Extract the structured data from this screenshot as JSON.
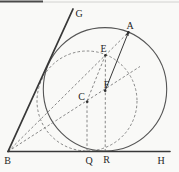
{
  "figure": {
    "width": 179,
    "height": 172,
    "background": "#f9f9f7",
    "colors": {
      "solid_line": "#383838",
      "large_circle": "#565656",
      "dashed": "#7b7b7b",
      "dot": "#2f2f2f",
      "label": "#262626",
      "scan_mark_dark": "#4a4a4a",
      "scan_mark_light": "#c9c9c6"
    },
    "dash_pattern": "2.6 2.1",
    "scan_marks": [
      {
        "name": "scan-edge-dark",
        "x1": 0,
        "y1": 1.5,
        "x2": 43,
        "y2": 1.5,
        "width": 2,
        "color_key": "scan_mark_dark"
      },
      {
        "name": "scan-edge-light",
        "x1": 43,
        "y1": 2.0,
        "x2": 179,
        "y2": 2.0,
        "width": 0.8,
        "color_key": "scan_mark_light"
      }
    ],
    "solid_lines": [
      {
        "name": "ray-b-h",
        "x1": 8,
        "y1": 151.5,
        "x2": 170,
        "y2": 151.5,
        "width": 1.6
      },
      {
        "name": "ray-b-g",
        "x1": 8,
        "y1": 151.5,
        "x2": 73,
        "y2": 9,
        "width": 1.8
      },
      {
        "name": "segment-f-a",
        "x1": 105.2,
        "y1": 90.5,
        "x2": 128.4,
        "y2": 32.4,
        "width": 1.0
      }
    ],
    "dashed_lines": [
      {
        "name": "line-b-e-a",
        "x1": 8,
        "y1": 151.5,
        "x2": 128.4,
        "y2": 32.4
      },
      {
        "name": "bisector-b-c-f",
        "x1": 8,
        "y1": 151.5,
        "x2": 140,
        "y2": 66.5
      },
      {
        "name": "segment-c-e",
        "x1": 87,
        "y1": 101,
        "x2": 105.5,
        "y2": 54.8
      },
      {
        "name": "segment-e-f-r",
        "x1": 105.4,
        "y1": 55,
        "x2": 105.2,
        "y2": 151.5
      },
      {
        "name": "segment-c-q",
        "x1": 87,
        "y1": 101,
        "x2": 87,
        "y2": 151.5
      }
    ],
    "circles": [
      {
        "name": "tangent-circle-solid",
        "cx": 105,
        "cy": 89.3,
        "r": 61.7,
        "style": "solid",
        "width": 1.1
      },
      {
        "name": "auxiliary-circle-dashed",
        "cx": 87,
        "cy": 101,
        "r": 50,
        "style": "dashed",
        "width": 0.9
      }
    ],
    "arrowhead": {
      "name": "arrowhead-at-a",
      "points": "128.8,31.1 128.67,35.9 125.53,34.63"
    },
    "dots": [
      {
        "name": "point-dot-a",
        "cx": 128.4,
        "cy": 32.4,
        "r": 1.3
      },
      {
        "name": "point-dot-e",
        "cx": 105.4,
        "cy": 55.2,
        "r": 1.3
      },
      {
        "name": "point-dot-f",
        "cx": 105.2,
        "cy": 90.8,
        "r": 1.3
      },
      {
        "name": "point-dot-c",
        "cx": 87.2,
        "cy": 101.8,
        "r": 1.3
      }
    ],
    "labels": [
      {
        "name": "label-g",
        "text": "G",
        "x": 79,
        "y": 17.2
      },
      {
        "name": "label-a",
        "text": "A",
        "x": 130,
        "y": 28.6
      },
      {
        "name": "label-e",
        "text": "E",
        "x": 103.5,
        "y": 52.0
      },
      {
        "name": "label-f",
        "text": "F",
        "x": 106.5,
        "y": 88.3
      },
      {
        "name": "label-c",
        "text": "C",
        "x": 81.5,
        "y": 100.2
      },
      {
        "name": "label-b",
        "text": "B",
        "x": 7.5,
        "y": 164.3
      },
      {
        "name": "label-q",
        "text": "Q",
        "x": 89,
        "y": 163.8
      },
      {
        "name": "label-r",
        "text": "R",
        "x": 106.6,
        "y": 163.3
      },
      {
        "name": "label-h",
        "text": "H",
        "x": 161,
        "y": 163.8
      }
    ]
  }
}
